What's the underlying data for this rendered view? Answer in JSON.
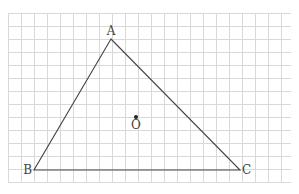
{
  "diagram": {
    "type": "triangle-on-grid",
    "grid": {
      "x0": 8,
      "y0": 13,
      "x1": 291,
      "y1": 182,
      "step": 13,
      "color": "#d9d9d9"
    },
    "stroke_color": "#444444",
    "vertices": {
      "A": {
        "label": "A",
        "x": 111,
        "y": 39
      },
      "B": {
        "label": "B",
        "x": 34,
        "y": 170
      },
      "C": {
        "label": "C",
        "x": 240,
        "y": 170
      }
    },
    "point_O": {
      "label": "O",
      "x": 136,
      "y": 117
    }
  }
}
